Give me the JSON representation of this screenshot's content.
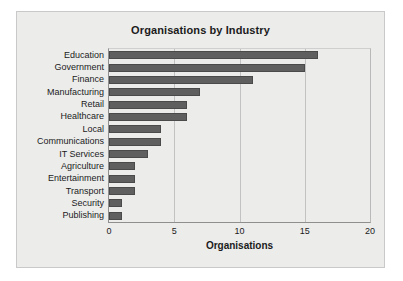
{
  "chart_data": {
    "type": "bar",
    "orientation": "horizontal",
    "title": "Organisations by Industry",
    "xlabel": "Organisations",
    "ylabel": "",
    "xlim": [
      0,
      20
    ],
    "xticks": [
      0,
      5,
      10,
      15,
      20
    ],
    "grid": true,
    "legend": null,
    "bar_color": "#5f5f5f",
    "plot_background": "#ececeb",
    "categories": [
      "Education",
      "Government",
      "Finance",
      "Manufacturing",
      "Retail",
      "Healthcare",
      "Local",
      "Communications",
      "IT Services",
      "Agriculture",
      "Entertainment",
      "Transport",
      "Security",
      "Publishing"
    ],
    "values": [
      16,
      15,
      11,
      7,
      6,
      6,
      4,
      4,
      3,
      2,
      2,
      2,
      1,
      1
    ]
  }
}
